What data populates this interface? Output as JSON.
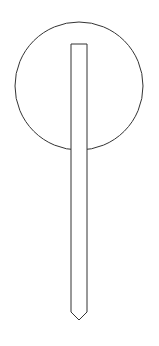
{
  "diagram": {
    "stroke_color": "#333333",
    "fill_color": "#ffffff",
    "circle": {
      "cx": 79,
      "cy": 86,
      "r": 64
    },
    "stem": {
      "x_left": 71,
      "x_right": 87,
      "y_top": 44,
      "y_shoulder": 312,
      "tip_x": 79,
      "tip_y": 320
    }
  }
}
